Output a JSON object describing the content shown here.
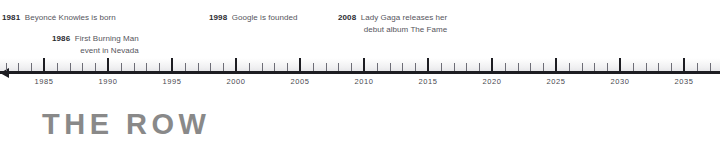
{
  "timeline": {
    "axis": {
      "start_year": 1981,
      "end_year": 2037,
      "tick_interval": 1,
      "label_interval": 5,
      "arrow_direction": "left",
      "axis_color": "#1d1d22",
      "tick_labels": [
        "1985",
        "1990",
        "1995",
        "2000",
        "2005",
        "2010",
        "2015",
        "2020",
        "2025",
        "2030",
        "2035"
      ],
      "tick_label_years": [
        1985,
        1990,
        1995,
        2000,
        2005,
        2010,
        2015,
        2020,
        2025,
        2030,
        2035
      ]
    },
    "events": [
      {
        "year": "1981",
        "line1": "Beyoncé Knowles is born",
        "line2": "",
        "x": 2,
        "y": 9
      },
      {
        "year": "1986",
        "line1": "First Burning Man",
        "line2": "event in Nevada",
        "x": 52,
        "y": 30
      },
      {
        "year": "1998",
        "line1": "Google is founded",
        "line2": "",
        "x": 209,
        "y": 9
      },
      {
        "year": "2008",
        "line1": "Lady Gaga releases her",
        "line2": "debut album The Fame",
        "x": 338,
        "y": 9
      }
    ]
  },
  "brand": {
    "text": "THE ROW",
    "color": "#898989"
  }
}
